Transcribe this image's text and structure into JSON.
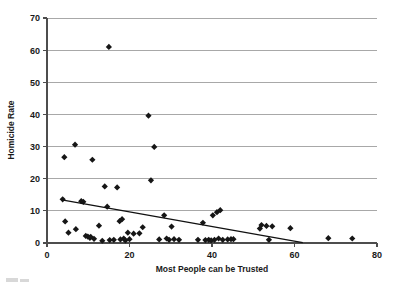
{
  "chart_data": {
    "type": "scatter",
    "title": "",
    "xlabel": "Most People can be Trusted",
    "ylabel": "Homicide Rate",
    "xlim": [
      0,
      80
    ],
    "ylim": [
      0,
      70
    ],
    "xticks": [
      0,
      20,
      40,
      60,
      80
    ],
    "yticks": [
      0,
      10,
      20,
      30,
      40,
      50,
      60,
      70
    ],
    "xtick_labels": [
      "0",
      "20",
      "40",
      "60",
      "80"
    ],
    "ytick_labels": [
      "0",
      "10",
      "20",
      "30",
      "40",
      "50",
      "60",
      "70"
    ],
    "grid": "horizontal",
    "legend": "none",
    "marker": "diamond",
    "marker_color": "#161616",
    "gridline_color": "#a8a8a8",
    "axis_color": "#4d4d4d",
    "points": [
      [
        4.2,
        26.7
      ],
      [
        3.8,
        13.6
      ],
      [
        4.4,
        6.7
      ],
      [
        5.2,
        3.2
      ],
      [
        6.8,
        30.6
      ],
      [
        7.0,
        4.3
      ],
      [
        8.3,
        13.0
      ],
      [
        8.8,
        12.8
      ],
      [
        9.4,
        2.2
      ],
      [
        9.9,
        2.0
      ],
      [
        10.4,
        1.6
      ],
      [
        10.6,
        1.9
      ],
      [
        11.0,
        25.9
      ],
      [
        11.4,
        1.3
      ],
      [
        12.6,
        5.4
      ],
      [
        13.4,
        0.7
      ],
      [
        14.0,
        17.6
      ],
      [
        14.6,
        11.3
      ],
      [
        15.0,
        61.0
      ],
      [
        15.2,
        0.9
      ],
      [
        16.2,
        1.0
      ],
      [
        17.0,
        17.3
      ],
      [
        17.6,
        6.8
      ],
      [
        17.8,
        1.1
      ],
      [
        18.2,
        7.4
      ],
      [
        18.6,
        1.4
      ],
      [
        19.0,
        0.8
      ],
      [
        19.6,
        3.2
      ],
      [
        20.0,
        1.2
      ],
      [
        21.0,
        2.9
      ],
      [
        22.4,
        3.0
      ],
      [
        23.2,
        4.9
      ],
      [
        24.6,
        39.6
      ],
      [
        25.2,
        19.5
      ],
      [
        26.0,
        29.9
      ],
      [
        27.2,
        1.1
      ],
      [
        28.4,
        8.6
      ],
      [
        29.0,
        1.4
      ],
      [
        29.6,
        1.0
      ],
      [
        30.2,
        5.1
      ],
      [
        30.8,
        1.2
      ],
      [
        32.0,
        1.0
      ],
      [
        36.6,
        1.0
      ],
      [
        37.8,
        6.3
      ],
      [
        38.4,
        0.9
      ],
      [
        39.2,
        1.0
      ],
      [
        39.8,
        0.8
      ],
      [
        40.2,
        8.6
      ],
      [
        40.6,
        1.0
      ],
      [
        41.2,
        9.6
      ],
      [
        41.6,
        1.4
      ],
      [
        42.0,
        10.2
      ],
      [
        42.6,
        1.0
      ],
      [
        43.8,
        1.1
      ],
      [
        44.6,
        1.2
      ],
      [
        45.2,
        1.2
      ],
      [
        51.6,
        4.5
      ],
      [
        52.0,
        5.6
      ],
      [
        53.2,
        5.3
      ],
      [
        53.8,
        1.0
      ],
      [
        54.6,
        5.2
      ],
      [
        59.0,
        4.6
      ],
      [
        68.2,
        1.5
      ],
      [
        74.0,
        1.4
      ]
    ],
    "trendline": {
      "label": "linear fit",
      "x0": 3.6,
      "y0": 13.4,
      "x1": 62.0,
      "y1": 0.1
    }
  }
}
